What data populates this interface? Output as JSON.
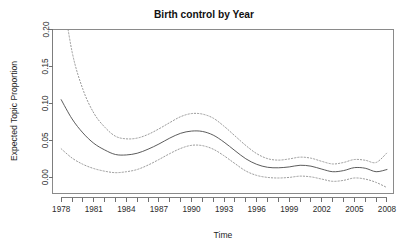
{
  "chart_data": {
    "type": "line",
    "title": "Birth control by Year",
    "xlabel": "Time",
    "ylabel": "Expected Topic Proportion",
    "xlim": [
      1977.2,
      2008.6
    ],
    "ylim": [
      -0.022,
      0.2
    ],
    "grid": false,
    "legend": false,
    "x_tick_labels": [
      "1978",
      "1981",
      "1984",
      "1987",
      "1990",
      "1993",
      "1996",
      "1999",
      "2002",
      "2005",
      "2008"
    ],
    "x_tick_values": [
      1978,
      1981,
      1984,
      1987,
      1990,
      1993,
      1996,
      1999,
      2002,
      2005,
      2008
    ],
    "x_minor_tick_values": [
      1978,
      1979,
      1980,
      1981,
      1982,
      1983,
      1984,
      1985,
      1986,
      1987,
      1988,
      1989,
      1990,
      1991,
      1992,
      1993,
      1994,
      1995,
      1996,
      1997,
      1998,
      1999,
      2000,
      2001,
      2002,
      2003,
      2004,
      2005,
      2006,
      2007,
      2008
    ],
    "y_tick_labels": [
      "0.00",
      "0.05",
      "0.10",
      "0.15",
      "0.20"
    ],
    "y_tick_values": [
      0.0,
      0.05,
      0.1,
      0.15,
      0.2
    ],
    "x": [
      1978,
      1979,
      1980,
      1981,
      1982,
      1983,
      1984,
      1985,
      1986,
      1987,
      1988,
      1989,
      1990,
      1991,
      1992,
      1993,
      1994,
      1995,
      1996,
      1997,
      1998,
      1999,
      2000,
      2001,
      2002,
      2003,
      2004,
      2005,
      2006,
      2007,
      2008
    ],
    "series": [
      {
        "name": "Expected topic proportion",
        "style": "solid",
        "values": [
          0.105,
          0.079,
          0.06,
          0.046,
          0.037,
          0.0308,
          0.0302,
          0.0325,
          0.038,
          0.045,
          0.053,
          0.0595,
          0.0625,
          0.062,
          0.057,
          0.0475,
          0.036,
          0.025,
          0.0175,
          0.0135,
          0.0128,
          0.014,
          0.0162,
          0.015,
          0.011,
          0.0075,
          0.009,
          0.013,
          0.0122,
          0.0075,
          0.0105
        ]
      },
      {
        "name": "Upper 95% confidence bound",
        "style": "dashed",
        "values": [
          0.26,
          0.17,
          0.119,
          0.087,
          0.068,
          0.0555,
          0.052,
          0.053,
          0.058,
          0.0655,
          0.074,
          0.082,
          0.0862,
          0.0855,
          0.08,
          0.069,
          0.056,
          0.043,
          0.032,
          0.0252,
          0.0232,
          0.0248,
          0.0272,
          0.0258,
          0.0215,
          0.018,
          0.02,
          0.024,
          0.023,
          0.02,
          0.033
        ]
      },
      {
        "name": "Lower 95% confidence bound",
        "style": "dashed",
        "values": [
          0.0385,
          0.026,
          0.0175,
          0.0118,
          0.0082,
          0.0062,
          0.0075,
          0.0105,
          0.0165,
          0.024,
          0.032,
          0.039,
          0.0432,
          0.0428,
          0.038,
          0.029,
          0.0185,
          0.0085,
          0.0025,
          -0.0002,
          -0.001,
          -0.0002,
          0.0015,
          0.0005,
          -0.0025,
          -0.0055,
          -0.0042,
          -0.001,
          -0.0025,
          -0.007,
          -0.014
        ]
      }
    ]
  }
}
